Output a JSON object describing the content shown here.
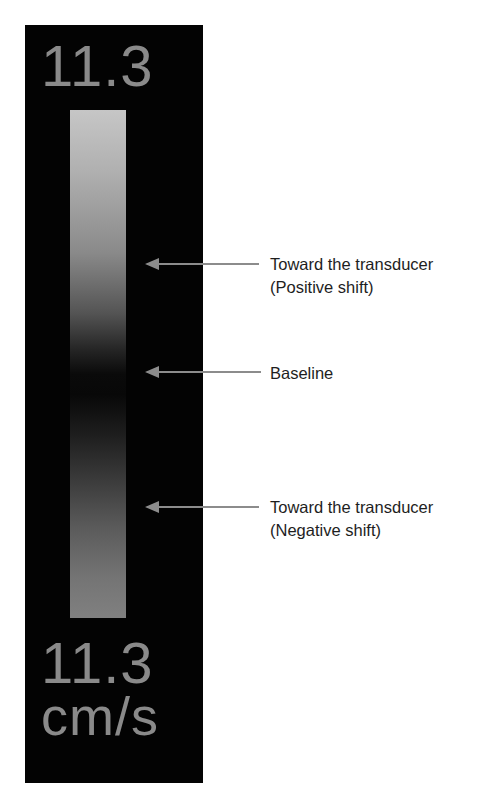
{
  "colors": {
    "panel_background": "#030303",
    "scale_text": "#8a8a8a",
    "arrow": "#8c8c8c",
    "annotation_text": "#1e1e1e",
    "bar_top": "#c6c6c6",
    "bar_center": "#080808",
    "bar_bottom": "#808080"
  },
  "color_scale": {
    "top_value": "11.3",
    "bottom_value": "11.3",
    "unit": "cm/s"
  },
  "annotations": [
    {
      "id": "positive",
      "line1": "Toward the transducer",
      "line2": "(Positive shift)",
      "arrow_icon": "arrow-left-icon"
    },
    {
      "id": "baseline",
      "line1": "Baseline",
      "arrow_icon": "arrow-left-icon"
    },
    {
      "id": "negative",
      "line1": "Toward the transducer",
      "line2": "(Negative shift)",
      "arrow_icon": "arrow-left-icon"
    }
  ]
}
